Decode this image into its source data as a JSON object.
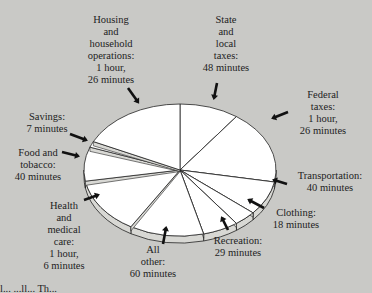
{
  "chart_data": {
    "type": "pie",
    "style": "3d-exploded-pie",
    "title": "",
    "unit": "minutes",
    "total_minutes": 480,
    "categories": [
      "State and local taxes",
      "Federal taxes",
      "Transportation",
      "Clothing",
      "Recreation",
      "All other",
      "Health and medical care",
      "Food and tobacco",
      "Savings",
      "Housing and household operations"
    ],
    "values": [
      48,
      86,
      40,
      18,
      29,
      60,
      66,
      40,
      7,
      86
    ],
    "labels": [
      "State\nand\nlocal\ntaxes:\n48 minutes",
      "Federal\ntaxes:\n1 hour,\n26 minutes",
      "Transportation:\n40 minutes",
      "Clothing:\n18 minutes",
      "Recreation:\n29 minutes",
      "All\nother:\n60 minutes",
      "Health\nand\nmedical\ncare:\n1 hour,\n6 minutes",
      "Food and\ntobacco:\n40 minutes",
      "Savings:\n7 minutes",
      "Housing\nand\nhousehold\noperations:\n1 hour,\n26 minutes"
    ],
    "legend": "none",
    "grid": false
  },
  "colors": {
    "background": "#c9c9c6",
    "slice_fill": "#ffffff",
    "slice_edge": "#d8d8d4",
    "outline": "#222222"
  },
  "caption": "l... ...ll... Th..."
}
